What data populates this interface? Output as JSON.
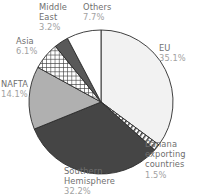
{
  "chart_data": {
    "type": "pie",
    "title": "",
    "xlabel": "",
    "ylabel": "",
    "legend_position": "callout-labels",
    "grid": false,
    "total_percent": 99.9,
    "start_angle_deg": 0,
    "direction": "clockwise",
    "categories": [
      "EU",
      "Banana exporting countries",
      "Southern Hemisphere",
      "NAFTA",
      "Asia",
      "Middle East",
      "Others"
    ],
    "values": [
      35.1,
      1.5,
      32.2,
      14.1,
      6.1,
      3.2,
      7.7
    ],
    "slices": [
      {
        "label": "EU",
        "value": 35.1,
        "value_text": "35.1%",
        "fill": "#f2f2f2",
        "pattern": "solid"
      },
      {
        "label": "Banana exporting countries",
        "label_line1": "Banana",
        "label_line2": "exporting",
        "label_line3": "countries",
        "value": 1.5,
        "value_text": "1.5%",
        "fill": "#ffffff",
        "pattern": "diagonal-stripes"
      },
      {
        "label": "Southern Hemisphere",
        "label_line1": "Southern",
        "label_line2": "Hemisphere",
        "value": 32.2,
        "value_text": "32.2%",
        "fill": "#454545",
        "pattern": "solid"
      },
      {
        "label": "NAFTA",
        "value": 14.1,
        "value_text": "14.1%",
        "fill": "#b0b0b0",
        "pattern": "solid"
      },
      {
        "label": "Asia",
        "value": 6.1,
        "value_text": "6.1%",
        "fill": "#ffffff",
        "pattern": "checkerboard"
      },
      {
        "label": "Middle East",
        "label_line1": "Middle",
        "label_line2": "East",
        "value": 3.2,
        "value_text": "3.2%",
        "fill": "#595959",
        "pattern": "solid"
      },
      {
        "label": "Others",
        "value": 7.7,
        "value_text": "7.7%",
        "fill": "#ffffff",
        "pattern": "solid"
      }
    ],
    "geometry": {
      "center_x": 101,
      "center_y": 102,
      "radius": 72
    },
    "colors": {
      "outline": "#2b2b2b",
      "label_text": "#6f6f6f",
      "percent_text": "#a2a2a2",
      "background": "#ffffff"
    }
  },
  "labels": {
    "eu": {
      "name": "EU",
      "pct": "35.1%"
    },
    "banana": {
      "line1": "Banana",
      "line2": "exporting",
      "line3": "countries",
      "pct": "1.5%"
    },
    "southern": {
      "line1": "Southern",
      "line2": "Hemisphere",
      "pct": "32.2%"
    },
    "nafta": {
      "name": "NAFTA",
      "pct": "14.1%"
    },
    "asia": {
      "name": "Asia",
      "pct": "6.1%"
    },
    "middle_east": {
      "line1": "Middle",
      "line2": "East",
      "pct": "3.2%"
    },
    "others": {
      "name": "Others",
      "pct": "7.7%"
    }
  }
}
